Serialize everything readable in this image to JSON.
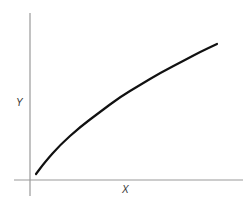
{
  "chart_data": {
    "type": "line",
    "title": "",
    "xlabel": "X",
    "ylabel": "Y",
    "grid": false,
    "legend": null,
    "ticks": {
      "x": [],
      "y": []
    },
    "series": [
      {
        "name": "Y vs X",
        "color": "#111111",
        "points_px": [
          [
            36,
            174
          ],
          [
            45,
            162
          ],
          [
            60,
            145
          ],
          [
            80,
            127
          ],
          [
            100,
            112
          ],
          [
            120,
            97
          ],
          [
            140,
            85
          ],
          [
            160,
            73
          ],
          [
            185,
            60
          ],
          [
            200,
            52
          ],
          [
            217,
            44
          ]
        ]
      }
    ],
    "axes": {
      "color": "#999999",
      "origin_px": [
        30,
        180
      ],
      "x_axis": {
        "from_px": 14,
        "to_px": 243
      },
      "y_axis": {
        "from_px": 13,
        "to_px": 196
      }
    }
  },
  "labels": {
    "x_axis": "X",
    "y_axis": "Y"
  }
}
